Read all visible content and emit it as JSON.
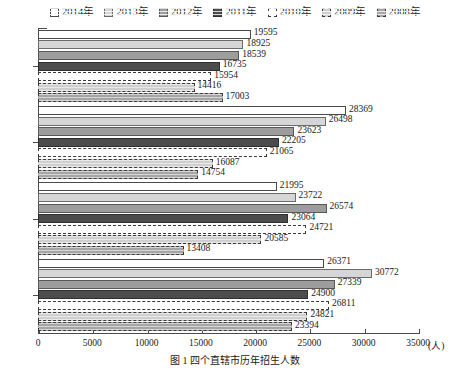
{
  "chart_data": {
    "type": "bar",
    "orientation": "horizontal",
    "title": "",
    "xlabel": "(人)",
    "ylabel": "",
    "xlim": [
      0,
      35000
    ],
    "xticks": [
      0,
      5000,
      10000,
      15000,
      20000,
      25000,
      30000,
      35000
    ],
    "xtick_labels": [
      "0",
      "5000",
      "10000",
      "15000",
      "20000",
      "25000",
      "30000",
      "35000"
    ],
    "unit_label": "(人)",
    "grid": false,
    "legend_position": "top",
    "categories": [
      "重庆",
      "上海",
      "天津",
      "北京"
    ],
    "series": [
      {
        "name": "2014年",
        "key": "s-2014",
        "color": "#ffffff",
        "values": [
          19595,
          28369,
          21995,
          26371
        ]
      },
      {
        "name": "2013年",
        "key": "s-2013",
        "color": "#d6d6d6",
        "values": [
          18925,
          26498,
          23722,
          30772
        ]
      },
      {
        "name": "2012年",
        "key": "s-2012",
        "color": "#9d9d9d",
        "values": [
          18539,
          23623,
          26574,
          27339
        ]
      },
      {
        "name": "2011年",
        "key": "s-2011",
        "color": "#4c4c4c",
        "values": [
          16735,
          22205,
          23064,
          24900
        ]
      },
      {
        "name": "2010年",
        "key": "s-2010",
        "color": "#ffffff",
        "values": [
          15954,
          21065,
          24721,
          26811
        ]
      },
      {
        "name": "2009年",
        "key": "s-2009",
        "color": "#cfcfcf",
        "values": [
          14416,
          16087,
          20585,
          24821
        ]
      },
      {
        "name": "2008年",
        "key": "s-2008",
        "color": "#a5a5a5",
        "values": [
          17003,
          14754,
          13408,
          23394
        ]
      }
    ]
  },
  "legend": {
    "items": [
      {
        "label": "2014年",
        "key": "s-2014"
      },
      {
        "label": "2013年",
        "key": "s-2013"
      },
      {
        "label": "2012年",
        "key": "s-2012"
      },
      {
        "label": "2011年",
        "key": "s-2011"
      },
      {
        "label": "2010年",
        "key": "s-2010"
      },
      {
        "label": "2009年",
        "key": "s-2009"
      },
      {
        "label": "2008年",
        "key": "s-2008"
      }
    ]
  },
  "caption": "图 1  四个直辖市历年招生人数"
}
